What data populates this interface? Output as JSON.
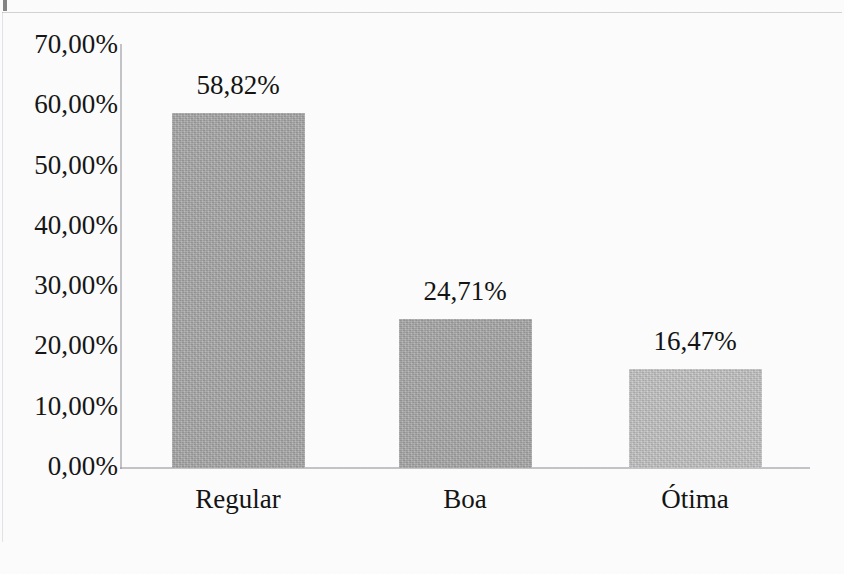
{
  "chart_data": {
    "type": "bar",
    "title": "",
    "subtitle": "",
    "xlabel": "",
    "ylabel": "",
    "categories": [
      "Regular",
      "Boa",
      "Ótima"
    ],
    "values": [
      58.82,
      24.71,
      16.47
    ],
    "value_labels": [
      "58,82%",
      "24,71%",
      "16,47%"
    ],
    "ylim": [
      0,
      70
    ],
    "ytick_values": [
      70,
      60,
      50,
      40,
      30,
      20,
      10,
      0
    ],
    "ytick_labels": [
      "70,00%",
      "60,00%",
      "50,00%",
      "40,00%",
      "30,00%",
      "20,00%",
      "10,00%",
      "0,00%"
    ],
    "grid": false,
    "legend": null,
    "legend_position": "none",
    "series": [
      {
        "name": "",
        "values": [
          58.82,
          24.71,
          16.47
        ]
      }
    ],
    "bar_colors": [
      "#a9a9a9",
      "#a9a9a9",
      "#c4c4c4"
    ],
    "axis_color": "#9a9a9e",
    "text_color": "#141414"
  },
  "axis": {
    "y_ticks": [
      {
        "label": "70,00%",
        "value": 70
      },
      {
        "label": "60,00%",
        "value": 60
      },
      {
        "label": "50,00%",
        "value": 50
      },
      {
        "label": "40,00%",
        "value": 40
      },
      {
        "label": "30,00%",
        "value": 30
      },
      {
        "label": "20,00%",
        "value": 20
      },
      {
        "label": "10,00%",
        "value": 10
      },
      {
        "label": "0,00%",
        "value": 0
      }
    ]
  },
  "bars": [
    {
      "category": "Regular",
      "value": 58.82,
      "label": "58,82%",
      "color": "#a9a9a9"
    },
    {
      "category": "Boa",
      "value": 24.71,
      "label": "24,71%",
      "color": "#a9a9a9"
    },
    {
      "category": "Ótima",
      "value": 16.47,
      "label": "16,47%",
      "color": "#c4c4c4"
    }
  ]
}
